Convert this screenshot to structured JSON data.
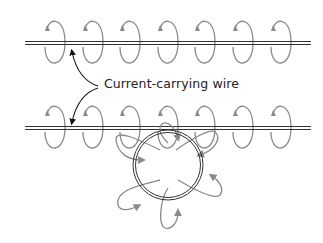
{
  "diagram": {
    "label": "Current-carrying wire",
    "colors": {
      "wire": "#333333",
      "field_lines": "#8a8a8a",
      "label_arrow": "#111111",
      "background": "#ffffff"
    },
    "top_wire": {
      "y": 43,
      "x1": 25,
      "x2": 311
    },
    "bottom_wire": {
      "y": 128,
      "x1": 25,
      "x2": 311
    },
    "loop_centers_x": [
      55,
      93,
      130,
      168,
      205,
      243,
      281
    ],
    "current_loop": {
      "cx": 168,
      "cy": 165,
      "r": 35
    }
  }
}
